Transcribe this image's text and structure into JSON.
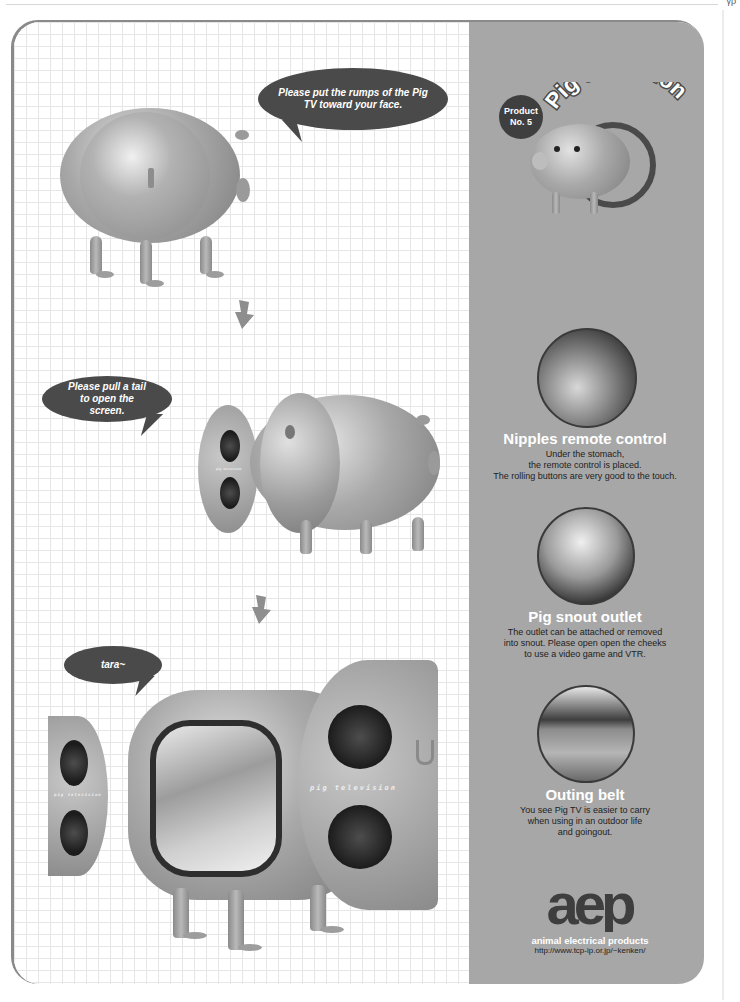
{
  "page": {
    "page_mark": "γρ"
  },
  "steps": [
    {
      "bubble": "Please put the rumps of the Pig TV toward your face."
    },
    {
      "bubble": "Please pull a tail to open the screen."
    },
    {
      "bubble": "tara~"
    }
  ],
  "illustrations": {
    "side_brand_text": "pig television",
    "door_brand_text": "pig television"
  },
  "header": {
    "badge_line1": "Product",
    "badge_line2": "No. 5",
    "title": "Pig television"
  },
  "features": [
    {
      "title": "Nipples remote control",
      "desc_lines": [
        "Under the stomach,",
        "the remote control is placed.",
        "The rolling buttons are very good to the touch."
      ]
    },
    {
      "title": "Pig snout outlet",
      "desc_lines": [
        "The outlet can be attached or removed",
        "into snout. Please open open the cheeks",
        "to use a video game and VTR."
      ]
    },
    {
      "title": "Outing belt",
      "desc_lines": [
        "You see Pig TV is easier to carry",
        "when using in an outdoor life",
        "and goingout."
      ]
    }
  ],
  "footer": {
    "logo": "aep",
    "company": "animal electrical products",
    "url": "http://www.tcp-ip.or.jp/~kenken/"
  },
  "colors": {
    "panel": "#a7a7a7",
    "bubble": "#4a4a4a",
    "grid_line": "#e6e6e6"
  }
}
